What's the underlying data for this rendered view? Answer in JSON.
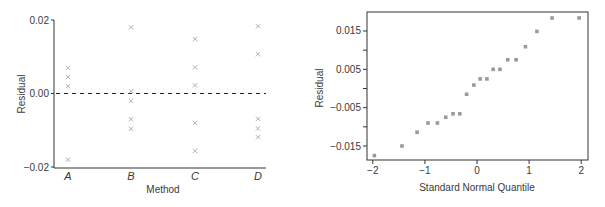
{
  "chart_data": [
    {
      "type": "scatter",
      "title": "",
      "xlabel": "Method",
      "ylabel": "Residual",
      "categories": [
        "A",
        "B",
        "C",
        "D"
      ],
      "ylim": [
        -0.02,
        0.02
      ],
      "yticks": [
        "0.02",
        "0.00",
        "−0.02"
      ],
      "ytick_values": [
        0.02,
        0.0,
        -0.02
      ],
      "grid": false,
      "marker": "x",
      "marker_color": "#a8a8a8",
      "reference_line": {
        "y": 0.0,
        "style": "dashed",
        "color": "#222222"
      },
      "series": [
        {
          "category": "A",
          "values": [
            0.007,
            0.0045,
            0.002,
            -0.018
          ]
        },
        {
          "category": "B",
          "values": [
            0.018,
            0.0006,
            -0.002,
            -0.007,
            -0.0096
          ]
        },
        {
          "category": "C",
          "values": [
            0.0148,
            0.0071,
            0.0022,
            -0.008,
            -0.0156
          ]
        },
        {
          "category": "D",
          "values": [
            0.0183,
            0.0107,
            -0.0069,
            -0.0095,
            -0.0119
          ]
        }
      ]
    },
    {
      "type": "scatter",
      "title": "",
      "xlabel": "Standard Normal Quantile",
      "ylabel": "Residual",
      "xlim": [
        -2.1,
        2.05
      ],
      "ylim": [
        -0.0195,
        0.0205
      ],
      "xticks": [
        "−2",
        "−1",
        "0",
        "1",
        "2"
      ],
      "xtick_values": [
        -2,
        -1,
        0,
        1,
        2
      ],
      "yticks": [
        "0.015",
        "0.005",
        "−0.005",
        "−0.015"
      ],
      "ytick_values": [
        0.015,
        0.005,
        -0.005,
        -0.015
      ],
      "minor_ytick_values": [
        0.01,
        0.0,
        -0.01
      ],
      "grid": false,
      "framed": true,
      "marker": "square",
      "marker_color": "#9a9a9a",
      "points": [
        {
          "x": -1.97,
          "y": -0.0175
        },
        {
          "x": -1.44,
          "y": -0.015
        },
        {
          "x": -1.15,
          "y": -0.0114
        },
        {
          "x": -0.94,
          "y": -0.009
        },
        {
          "x": -0.76,
          "y": -0.009
        },
        {
          "x": -0.6,
          "y": -0.0075
        },
        {
          "x": -0.46,
          "y": -0.0066
        },
        {
          "x": -0.33,
          "y": -0.0066
        },
        {
          "x": -0.2,
          "y": -0.0015
        },
        {
          "x": -0.06,
          "y": 0.0009
        },
        {
          "x": 0.06,
          "y": 0.0025
        },
        {
          "x": 0.19,
          "y": 0.0025
        },
        {
          "x": 0.31,
          "y": 0.005
        },
        {
          "x": 0.44,
          "y": 0.005
        },
        {
          "x": 0.59,
          "y": 0.0075
        },
        {
          "x": 0.75,
          "y": 0.0075
        },
        {
          "x": 0.93,
          "y": 0.0109
        },
        {
          "x": 1.15,
          "y": 0.0149
        },
        {
          "x": 1.44,
          "y": 0.0184
        },
        {
          "x": 1.96,
          "y": 0.0184
        }
      ]
    }
  ]
}
